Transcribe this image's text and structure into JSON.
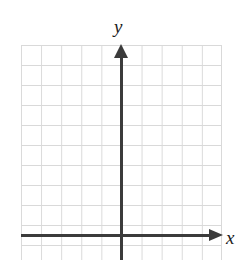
{
  "figure": {
    "type": "coordinate-plane",
    "width": 244,
    "height": 260,
    "background_color": "#ffffff",
    "title": "",
    "axis_labels": {
      "x": "x",
      "y": "y"
    },
    "colors": {
      "grid_line": "#d9d9d9",
      "axis": "#3b3b3b",
      "label_text": "#1b1b1b"
    }
  },
  "chart_data": {
    "type": "scatter",
    "title": "",
    "subtitle": "",
    "xlabel": "x",
    "ylabel": "y",
    "series": [],
    "annotations": [],
    "legend": null,
    "legend_position": "none",
    "grid": true,
    "grid_spacing_px": 20,
    "grid_columns": 10,
    "grid_rows": 11,
    "xlim": [
      -5,
      5
    ],
    "ylim": [
      -1,
      9.5
    ],
    "xticks": [
      -5,
      -4,
      -3,
      -2,
      -1,
      0,
      1,
      2,
      3,
      4,
      5
    ],
    "yticks": [
      -1,
      0,
      1,
      2,
      3,
      4,
      5,
      6,
      7,
      8,
      9
    ],
    "tick_labels_shown": false,
    "origin_px": {
      "x": 121,
      "y": 236
    },
    "axis_arrows": {
      "x": "right",
      "y": "up"
    }
  }
}
